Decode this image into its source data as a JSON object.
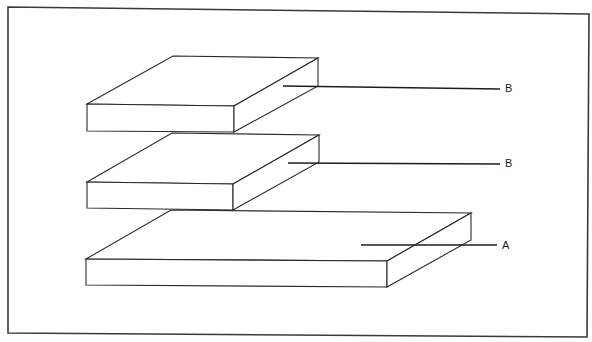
{
  "diagram": {
    "frame": {
      "stroke": "#3a3a3a"
    },
    "slabs": [
      {
        "id": "top",
        "label": "B"
      },
      {
        "id": "middle",
        "label": "B"
      },
      {
        "id": "bottom",
        "label": "A"
      }
    ],
    "labels": [
      {
        "text": "B",
        "target": "top slab"
      },
      {
        "text": "B",
        "target": "middle slab"
      },
      {
        "text": "A",
        "target": "bottom slab"
      }
    ]
  }
}
